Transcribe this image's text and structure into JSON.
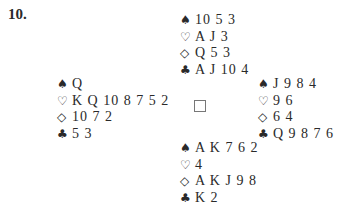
{
  "problem_number": "10.",
  "suits": {
    "spades": "♠",
    "hearts": "♡",
    "diamonds": "◇",
    "clubs": "♣"
  },
  "hands": {
    "north": {
      "spades": "10 5 3",
      "hearts": "A J 3",
      "diamonds": "Q 5 3",
      "clubs": "A J 10 4"
    },
    "west": {
      "spades": "Q",
      "hearts": "K Q 10 8 7 5 2",
      "diamonds": "10 7 2",
      "clubs": "5 3"
    },
    "east": {
      "spades": "J 9 8 4",
      "hearts": "9 6",
      "diamonds": "6 4",
      "clubs": "Q 9 8 7 6"
    },
    "south": {
      "spades": "A K 7 6 2",
      "hearts": "4",
      "diamonds": "A K J 9 8",
      "clubs": "K 2"
    }
  }
}
